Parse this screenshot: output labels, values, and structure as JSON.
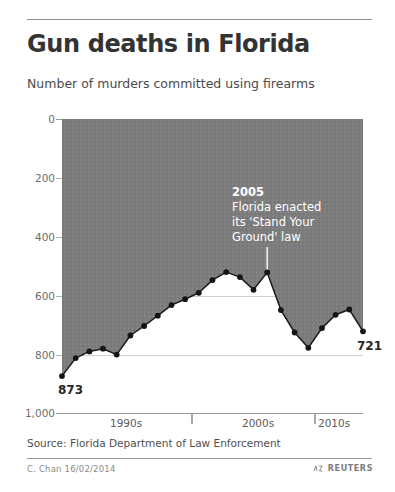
{
  "header": {
    "title": "Gun deaths in Florida",
    "subtitle": "Number of murders committed using firearms"
  },
  "footer": {
    "source": "Source: Florida Department of Law Enforcement",
    "byline": "C. Chan 16/02/2014",
    "agency": "REUTERS",
    "agency_icon": "reuters-logo-icon"
  },
  "annotation": {
    "year": "2005",
    "line1": "Florida enacted",
    "line2": "its 'Stand Your",
    "line3": "Ground' law"
  },
  "endpoints": {
    "first_label": "873",
    "last_label": "721"
  },
  "colors": {
    "fill": "#7d7d7d",
    "line": "#1a1a1a",
    "text": "#3a3a3a",
    "grid": "#cfcfcf",
    "annotation_text": "#ffffff"
  },
  "chart_data": {
    "type": "area",
    "title": "Gun deaths in Florida",
    "subtitle": "Number of murders committed using firearms",
    "xlabel": "",
    "ylabel": "Number of murders committed using firearms",
    "y_inverted": true,
    "ylim": [
      0,
      1000
    ],
    "yticks": [
      0,
      200,
      400,
      600,
      800,
      1000
    ],
    "ytick_labels": [
      "0",
      "200",
      "400",
      "600",
      "800",
      "1,000"
    ],
    "xlim": [
      1990,
      2012
    ],
    "xtick_labels": [
      "1990s",
      "2000s",
      "2010s"
    ],
    "xtick_values": [
      1995,
      2005,
      2011
    ],
    "xtick_marks": [
      2000,
      2010
    ],
    "grid": true,
    "legend": null,
    "series_name": "Murders committed using firearms",
    "x": [
      1990,
      1991,
      1992,
      1993,
      1994,
      1995,
      1996,
      1997,
      1998,
      1999,
      2000,
      2001,
      2002,
      2003,
      2004,
      2005,
      2006,
      2007,
      2008,
      2009,
      2010,
      2011,
      2012
    ],
    "values": [
      873,
      812,
      789,
      780,
      800,
      735,
      703,
      668,
      632,
      612,
      590,
      547,
      520,
      537,
      580,
      521,
      649,
      725,
      777,
      710,
      665,
      647,
      721
    ],
    "annotations": [
      {
        "x": 2005,
        "y": 521,
        "text": "2005 Florida enacted its 'Stand Your Ground' law"
      }
    ],
    "point_labels": [
      {
        "x": 1990,
        "y": 873,
        "label": "873"
      },
      {
        "x": 2012,
        "y": 721,
        "label": "721"
      }
    ]
  }
}
